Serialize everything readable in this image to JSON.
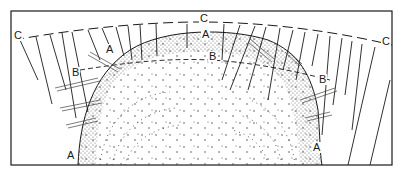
{
  "figure": {
    "type": "cross-section-diagram",
    "frame": {
      "left": 11,
      "top": 11,
      "right": 392,
      "bottom": 165
    },
    "colors": {
      "ink": "#1a1a1a",
      "paper": "#ffffff",
      "stipple": "#333333"
    },
    "labels": [
      {
        "id": "C-left",
        "text": "C",
        "x": 15,
        "y": 32
      },
      {
        "id": "C-top",
        "text": "C",
        "x": 201,
        "y": 14
      },
      {
        "id": "C-right",
        "text": "C",
        "x": 383,
        "y": 37
      },
      {
        "id": "A-left-upper",
        "text": "A",
        "x": 107,
        "y": 46
      },
      {
        "id": "A-top",
        "text": "A",
        "x": 203,
        "y": 30
      },
      {
        "id": "A-left-lower",
        "text": "A",
        "x": 68,
        "y": 152
      },
      {
        "id": "A-right-lower",
        "text": "A",
        "x": 314,
        "y": 144
      },
      {
        "id": "B-left",
        "text": "B",
        "x": 73,
        "y": 69
      },
      {
        "id": "B-top",
        "text": "B",
        "x": 210,
        "y": 52
      },
      {
        "id": "B-right",
        "text": "B",
        "x": 320,
        "y": 75
      }
    ],
    "zones": {
      "A": "outer surface boundary of dome",
      "B": "inner dashed boundary",
      "C": "outer dashed arc with radial lines"
    }
  }
}
